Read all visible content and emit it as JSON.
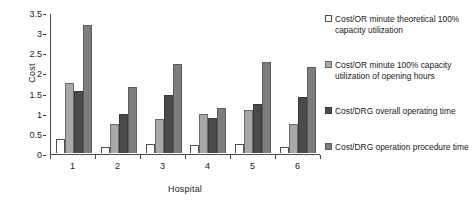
{
  "chart_data": {
    "type": "bar",
    "title": "",
    "xlabel": "Hospital",
    "ylabel": "Cost",
    "categories": [
      "1",
      "2",
      "3",
      "4",
      "5",
      "6"
    ],
    "ylim": [
      0,
      3.5
    ],
    "yticks": [
      0,
      0.5,
      1,
      1.5,
      2,
      2.5,
      3,
      3.5
    ],
    "ytick_labels": [
      "0",
      "0.5",
      "1",
      "1.5",
      "2",
      "2.5",
      "3",
      "3.5"
    ],
    "grid": false,
    "legend_position": "right",
    "series": [
      {
        "name": "Cost/OR minute theoretical 100% capacity utilization",
        "color": "#ffffff",
        "values": [
          0.35,
          0.15,
          0.22,
          0.19,
          0.22,
          0.15
        ]
      },
      {
        "name": "Cost/OR minute 100% capacity utilization of opening hours",
        "color": "#a8a8a8",
        "values": [
          1.75,
          0.72,
          0.84,
          0.98,
          1.08,
          0.73
        ]
      },
      {
        "name": "Cost/DRG overall operating time",
        "color": "#4a4a4a",
        "values": [
          1.55,
          0.96,
          1.43,
          0.88,
          1.22,
          1.4
        ]
      },
      {
        "name": "Cost/DRG operation procedure time",
        "color": "#7d7d7d",
        "values": [
          3.17,
          1.65,
          2.2,
          1.11,
          2.27,
          2.13
        ]
      }
    ]
  },
  "legend": {
    "entries": [
      {
        "label": "Cost/OR minute theoretical 100% capacity utilization",
        "top": 2
      },
      {
        "label": "Cost/OR minute 100% capacity utilization of opening hours",
        "top": 48
      },
      {
        "label": "Cost/DRG overall operating time",
        "top": 94
      },
      {
        "label": "Cost/DRG operation procedure time",
        "top": 130
      }
    ]
  }
}
